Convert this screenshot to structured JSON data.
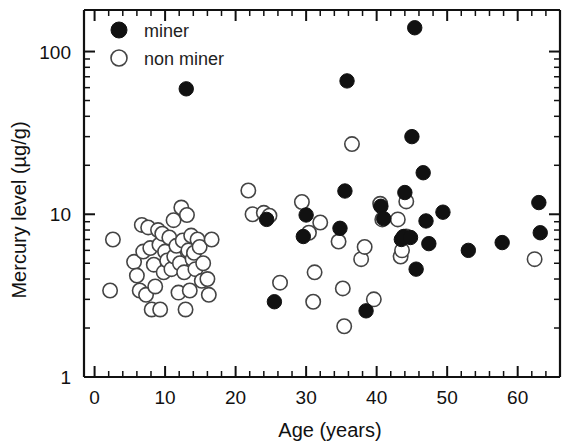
{
  "chart_data": {
    "type": "scatter",
    "title": "",
    "xlabel": "Age (years)",
    "ylabel": "Mercury level (µg/g)",
    "yscale": "log",
    "xlim": [
      -1.5,
      66
    ],
    "ylim": [
      1,
      180
    ],
    "xticks": [
      0,
      10,
      20,
      30,
      40,
      50,
      60
    ],
    "xtick_labels": [
      "0",
      "10",
      "20",
      "30",
      "40",
      "50",
      "60"
    ],
    "yticks": [
      1,
      10,
      100
    ],
    "ytick_labels": [
      "1",
      "10",
      "100"
    ],
    "grid": false,
    "legend_position": "top-left",
    "legend": [
      {
        "name": "miner",
        "marker": "filled-circle",
        "color": "#111111"
      },
      {
        "name": "non miner",
        "marker": "open-circle",
        "color": "#ffffff"
      }
    ],
    "series": [
      {
        "name": "miner",
        "marker": "filled-circle",
        "points": [
          [
            13.0,
            59.0
          ],
          [
            24.4,
            9.3
          ],
          [
            25.5,
            2.9
          ],
          [
            29.6,
            7.3
          ],
          [
            30.0,
            9.9
          ],
          [
            34.8,
            8.2
          ],
          [
            35.8,
            66.0
          ],
          [
            35.5,
            13.9
          ],
          [
            38.5,
            2.55
          ],
          [
            40.6,
            11.2
          ],
          [
            41.0,
            9.4
          ],
          [
            43.5,
            7.0
          ],
          [
            43.8,
            7.3
          ],
          [
            44.0,
            13.6
          ],
          [
            44.8,
            7.2
          ],
          [
            45.4,
            140.0
          ],
          [
            45.0,
            30.0
          ],
          [
            45.6,
            4.6
          ],
          [
            46.6,
            18.0
          ],
          [
            47.0,
            9.1
          ],
          [
            47.4,
            6.6
          ],
          [
            49.4,
            10.3
          ],
          [
            53.0,
            6.0
          ],
          [
            57.8,
            6.7
          ],
          [
            63.0,
            11.8
          ],
          [
            63.2,
            7.7
          ]
        ]
      },
      {
        "name": "non miner",
        "marker": "open-circle",
        "points": [
          [
            2.6,
            7.0
          ],
          [
            2.2,
            3.4
          ],
          [
            5.6,
            5.1
          ],
          [
            6.0,
            4.2
          ],
          [
            6.4,
            3.4
          ],
          [
            6.7,
            8.6
          ],
          [
            6.9,
            5.9
          ],
          [
            7.3,
            3.2
          ],
          [
            7.6,
            8.3
          ],
          [
            7.9,
            6.2
          ],
          [
            8.1,
            2.6
          ],
          [
            8.4,
            4.9
          ],
          [
            8.6,
            3.6
          ],
          [
            9.0,
            8.0
          ],
          [
            9.2,
            6.5
          ],
          [
            9.3,
            2.6
          ],
          [
            9.6,
            7.6
          ],
          [
            9.8,
            4.4
          ],
          [
            10.0,
            5.9
          ],
          [
            10.3,
            5.2
          ],
          [
            10.6,
            7.2
          ],
          [
            10.9,
            4.6
          ],
          [
            11.2,
            9.2
          ],
          [
            11.3,
            5.5
          ],
          [
            11.6,
            6.4
          ],
          [
            11.9,
            3.3
          ],
          [
            12.1,
            5.0
          ],
          [
            12.3,
            11.0
          ],
          [
            12.5,
            6.9
          ],
          [
            12.7,
            4.4
          ],
          [
            12.9,
            2.6
          ],
          [
            13.1,
            9.9
          ],
          [
            13.3,
            6.0
          ],
          [
            13.5,
            3.4
          ],
          [
            13.7,
            7.4
          ],
          [
            13.9,
            5.3
          ],
          [
            14.1,
            5.8
          ],
          [
            14.3,
            4.6
          ],
          [
            14.6,
            7.0
          ],
          [
            14.9,
            6.3
          ],
          [
            15.2,
            3.9
          ],
          [
            15.4,
            5.0
          ],
          [
            16.2,
            3.2
          ],
          [
            16.6,
            7.0
          ],
          [
            16.0,
            4.0
          ],
          [
            21.8,
            14.0
          ],
          [
            22.4,
            10.0
          ],
          [
            24.0,
            10.2
          ],
          [
            24.8,
            9.8
          ],
          [
            26.3,
            3.8
          ],
          [
            29.4,
            11.9
          ],
          [
            30.4,
            7.7
          ],
          [
            31.2,
            4.4
          ],
          [
            31.0,
            2.9
          ],
          [
            32.0,
            8.9
          ],
          [
            34.6,
            6.8
          ],
          [
            35.4,
            2.05
          ],
          [
            35.2,
            3.5
          ],
          [
            36.5,
            27.0
          ],
          [
            37.8,
            5.3
          ],
          [
            38.3,
            6.3
          ],
          [
            39.6,
            3.0
          ],
          [
            40.5,
            11.6
          ],
          [
            40.8,
            9.3
          ],
          [
            43.0,
            9.3
          ],
          [
            43.4,
            5.5
          ],
          [
            43.6,
            6.0
          ],
          [
            44.2,
            12.0
          ],
          [
            44.2,
            7.3
          ],
          [
            62.4,
            5.3
          ]
        ]
      }
    ]
  },
  "axes": {
    "x_label": "Age (years)",
    "y_label": "Mercury level (µg/g)",
    "x_tick_labels": [
      "0",
      "10",
      "20",
      "30",
      "40",
      "50",
      "60"
    ],
    "y_tick_labels": [
      "100",
      "10",
      "1"
    ]
  },
  "legend": {
    "miner_label": "miner",
    "non_miner_label": "non miner"
  },
  "colors": {
    "miner_fill": "#111111",
    "non_miner_fill": "#ffffff",
    "non_miner_stroke": "#444444",
    "axis": "#111111",
    "text": "#111111",
    "background": "#ffffff"
  }
}
